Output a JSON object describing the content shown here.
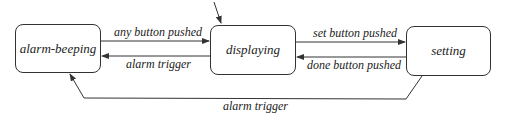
{
  "states": {
    "alarm_beeping": "alarm-beeping",
    "displaying": "displaying",
    "setting": "setting"
  },
  "transitions": {
    "beeping_to_displaying": "any button pushed",
    "displaying_to_beeping": "alarm trigger",
    "displaying_to_setting": "set button pushed",
    "setting_to_displaying": "done button pushed",
    "setting_to_beeping": "alarm trigger"
  },
  "initial_state": "displaying"
}
